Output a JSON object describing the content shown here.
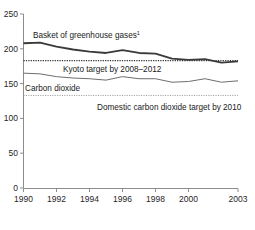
{
  "chart_data": {
    "type": "line",
    "title": "",
    "subtitle": "",
    "xlabel": "",
    "ylabel": "",
    "xlim": [
      1990,
      2003
    ],
    "ylim": [
      0,
      250
    ],
    "grid": false,
    "legend_position": "inline-labels",
    "x_tick_labels": [
      "1990",
      "1992",
      "1994",
      "1996",
      "1998",
      "2000",
      "2003"
    ],
    "x_ticks": [
      1990,
      1992,
      1994,
      1996,
      1998,
      2000,
      2003
    ],
    "y_tick_labels": [
      "0",
      "50",
      "100",
      "150",
      "200",
      "250"
    ],
    "y_ticks": [
      0,
      50,
      100,
      150,
      200,
      250
    ],
    "x": [
      1990,
      1991,
      1992,
      1993,
      1994,
      1995,
      1996,
      1997,
      1998,
      1999,
      2000,
      2001,
      2002,
      2003
    ],
    "series": [
      {
        "name": "Basket of greenhouse gases",
        "label": "Basket of greenhouse gases",
        "label_superscript": "1",
        "style": "solid-thick",
        "color": "#3a3a3a",
        "values": [
          208,
          209,
          203,
          199,
          196,
          194,
          198,
          194,
          193,
          186,
          184,
          185,
          180,
          182
        ]
      },
      {
        "name": "Carbon dioxide",
        "label": "Carbon dioxide",
        "label_superscript": "",
        "style": "solid-thin",
        "color": "#6e6e6e",
        "values": [
          165,
          164,
          160,
          158,
          157,
          155,
          160,
          157,
          157,
          152,
          153,
          157,
          152,
          154
        ]
      }
    ],
    "reference_lines": [
      {
        "name": "kyoto-target",
        "label": "Kyoto target by 2008–2012",
        "value": 183,
        "style": "dotted",
        "color": "#2b2b2b"
      },
      {
        "name": "domestic-co2-target",
        "label": "Domestic carbon dioxide target by 2010",
        "value": 133,
        "style": "dotted",
        "color": "#9a9a9a"
      }
    ]
  },
  "axis": {
    "y_labels": [
      "250",
      "200",
      "150",
      "100",
      "50",
      "0"
    ],
    "x_labels": [
      "1990",
      "1992",
      "1994",
      "1996",
      "1998",
      "2000",
      "2003"
    ]
  },
  "annotations": {
    "greenhouse_label": "Basket of greenhouse gases",
    "greenhouse_superscript": "1",
    "kyoto_label": "Kyoto target by 2008–2012",
    "co2_label": "Carbon dioxide",
    "domestic_label": "Domestic carbon dioxide target by 2010"
  },
  "colors": {
    "axis": "#8c8c8c",
    "greenhouse_line": "#3a3a3a",
    "co2_line": "#6e6e6e",
    "kyoto_dotted": "#2b2b2b",
    "domestic_dotted": "#9a9a9a",
    "text": "#1a1a1a",
    "background": "#ffffff"
  }
}
